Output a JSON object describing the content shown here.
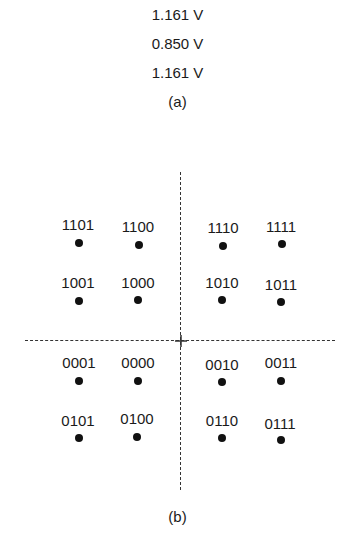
{
  "part_a": {
    "voltages": [
      "1.161 V",
      "0.850 V",
      "1.161 V"
    ],
    "caption": "(a)"
  },
  "part_b": {
    "caption": "(b)",
    "points": [
      {
        "label": "1101",
        "lx": 78,
        "ly": 225,
        "dx": 79,
        "dy": 243
      },
      {
        "label": "1100",
        "lx": 138,
        "ly": 227,
        "dx": 139,
        "dy": 245
      },
      {
        "label": "1110",
        "lx": 223,
        "ly": 228,
        "dx": 223,
        "dy": 246
      },
      {
        "label": "1111",
        "lx": 281,
        "ly": 227,
        "dx": 282,
        "dy": 244
      },
      {
        "label": "1001",
        "lx": 78,
        "ly": 283,
        "dx": 79,
        "dy": 301
      },
      {
        "label": "1000",
        "lx": 138,
        "ly": 283,
        "dx": 138,
        "dy": 300
      },
      {
        "label": "1010",
        "lx": 222,
        "ly": 283,
        "dx": 222,
        "dy": 300
      },
      {
        "label": "1011",
        "lx": 281,
        "ly": 285,
        "dx": 281,
        "dy": 302
      },
      {
        "label": "0001",
        "lx": 79,
        "ly": 363,
        "dx": 79,
        "dy": 381
      },
      {
        "label": "0000",
        "lx": 138,
        "ly": 363,
        "dx": 138,
        "dy": 381
      },
      {
        "label": "0010",
        "lx": 222,
        "ly": 365,
        "dx": 222,
        "dy": 382
      },
      {
        "label": "0011",
        "lx": 281,
        "ly": 363,
        "dx": 281,
        "dy": 381
      },
      {
        "label": "0101",
        "lx": 78,
        "ly": 421,
        "dx": 79,
        "dy": 438
      },
      {
        "label": "0100",
        "lx": 137,
        "ly": 419,
        "dx": 137,
        "dy": 437
      },
      {
        "label": "0110",
        "lx": 222,
        "ly": 421,
        "dx": 222,
        "dy": 438
      },
      {
        "label": "0111",
        "lx": 280,
        "ly": 424,
        "dx": 281,
        "dy": 440
      }
    ]
  }
}
